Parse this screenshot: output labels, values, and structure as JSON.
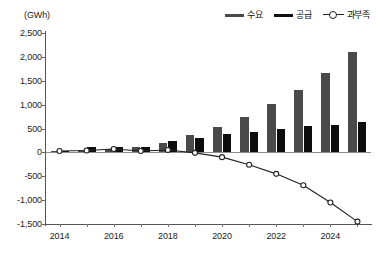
{
  "chart_data": {
    "type": "bar",
    "title": "",
    "subtitle": "",
    "xlabel": "",
    "ylabel": "",
    "unit_label": "(GWh)",
    "categories": [
      "2014",
      "2015",
      "2016",
      "2017",
      "2018",
      "2019",
      "2020",
      "2021",
      "2022",
      "2023",
      "2024",
      "2025"
    ],
    "x_tick_labels": [
      "2014",
      "2016",
      "2018",
      "2020",
      "2022",
      "2024"
    ],
    "x_tick_years": [
      2014,
      2016,
      2018,
      2020,
      2022,
      2024
    ],
    "y_tick_labels": [
      "2,500",
      "2,000",
      "1,500",
      "1,000",
      "500",
      "0",
      "-500",
      "-1,000",
      "-1,500"
    ],
    "y_ticks": [
      2500,
      2000,
      1500,
      1000,
      500,
      0,
      -500,
      -1000,
      -1500
    ],
    "ylim": [
      -1500,
      2500
    ],
    "grid": false,
    "legend_position": "top-right",
    "series": [
      {
        "name": "수요",
        "type": "bar",
        "color": "#4a4a4a",
        "values": [
          30,
          60,
          70,
          120,
          200,
          370,
          540,
          740,
          1020,
          1310,
          1670,
          2110
        ]
      },
      {
        "name": "공급",
        "type": "bar",
        "color": "#0d0d0d",
        "values": [
          20,
          120,
          110,
          110,
          240,
          300,
          390,
          430,
          490,
          550,
          580,
          645
        ]
      },
      {
        "name": "과부족",
        "type": "line",
        "color": "#222222",
        "marker": "open-circle",
        "values": [
          30,
          40,
          70,
          30,
          50,
          -10,
          -100,
          -260,
          -450,
          -690,
          -1050,
          -1450
        ]
      }
    ]
  },
  "legend": {
    "items": [
      {
        "label": "수요",
        "marker": "line-swatch-demand"
      },
      {
        "label": "공급",
        "marker": "line-swatch-supply"
      },
      {
        "label": "과부족",
        "marker": "line-circle-marker"
      }
    ]
  },
  "colors": {
    "demand": "#4a4a4a",
    "supply": "#0d0d0d",
    "deficit_line": "#222222",
    "axis": "#555555",
    "background": "#ffffff"
  }
}
